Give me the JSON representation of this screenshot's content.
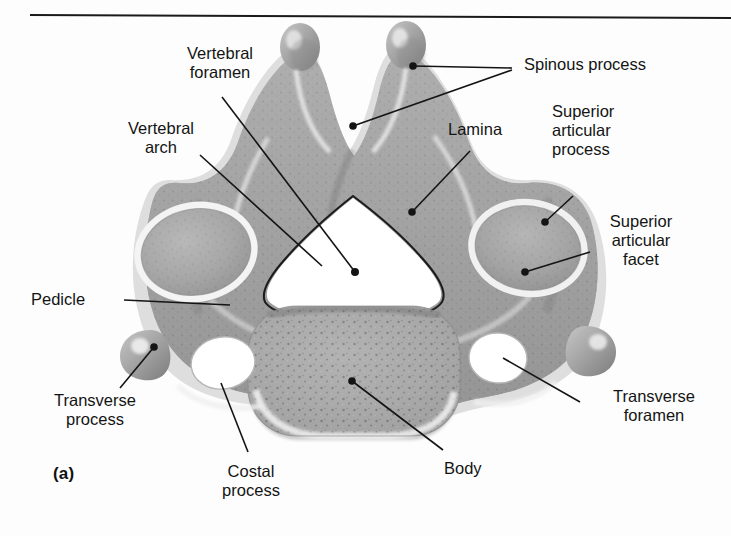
{
  "figure": {
    "marker": "(a)",
    "rule_color": "#1a1a1a",
    "bone_color": "#a9a9a9",
    "bone_highlight": "#efefef",
    "bone_shadow": "#6e6e6e",
    "line_color": "#141414",
    "background": "#fdfdfd"
  },
  "labels": {
    "vertebral_foramen": "Vertebral\nforamen",
    "vertebral_arch": "Vertebral\narch",
    "spinous_process": "Spinous process",
    "lamina": "Lamina",
    "superior_articular_process": "Superior\narticular\nprocess",
    "superior_articular_facet": "Superior\narticular\nfacet",
    "pedicle": "Pedicle",
    "transverse_process": "Transverse\nprocess",
    "costal_process": "Costal\nprocess",
    "transverse_foramen": "Transverse\nforamen",
    "body": "Body"
  }
}
